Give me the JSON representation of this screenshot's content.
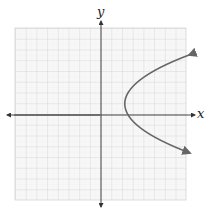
{
  "figure": {
    "type": "coordinate-plane-graph",
    "axes": {
      "x_label": "x",
      "y_label": "y"
    },
    "grid": {
      "visible": true,
      "cells_x": 16,
      "cells_y": 16
    },
    "curve": {
      "shape": "parabola-opening-right",
      "color": "#666666",
      "arrows": "both-ends"
    },
    "colors": {
      "axis": "#444444",
      "grid": "#d8d8d8",
      "background": "#ffffff"
    }
  }
}
